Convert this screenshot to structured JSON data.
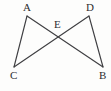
{
  "figure": {
    "background_color": "#fdfdfc",
    "line_color": "#3f3f42",
    "label_color": "#2e2e30",
    "points": {
      "A": {
        "label": "A",
        "x": 27,
        "y": 16,
        "label_x": 23,
        "label_y": 2
      },
      "B": {
        "label": "B",
        "x": 103,
        "y": 67,
        "label_x": 99,
        "label_y": 70
      },
      "C": {
        "label": "C",
        "x": 14,
        "y": 67,
        "label_x": 10,
        "label_y": 70
      },
      "D": {
        "label": "D",
        "x": 89,
        "y": 16,
        "label_x": 86,
        "label_y": 2
      },
      "E": {
        "label": "E",
        "x": 58,
        "y": 34,
        "label_x": 54,
        "label_y": 19
      }
    },
    "segments": [
      {
        "name": "segment-AC",
        "from": "A",
        "to": "C"
      },
      {
        "name": "segment-AB",
        "from": "A",
        "to": "B"
      },
      {
        "name": "segment-CD",
        "from": "C",
        "to": "D"
      },
      {
        "name": "segment-DB",
        "from": "D",
        "to": "B"
      }
    ]
  }
}
